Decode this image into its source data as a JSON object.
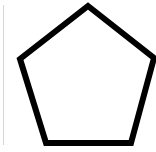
{
  "shape": {
    "type": "pentagon",
    "stroke_color": "#000000",
    "fill_color": "#ffffff",
    "stroke_width": 6,
    "points": "88,6 154,58 131,143 46,143 20,59"
  },
  "edge_line_color": "#d6d6d6"
}
